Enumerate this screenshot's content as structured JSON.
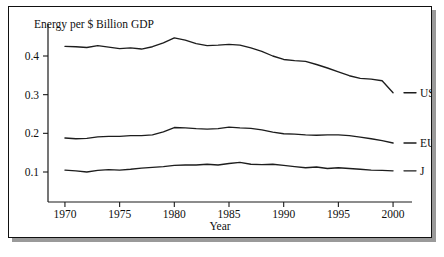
{
  "chart_data": {
    "type": "line",
    "title": "",
    "ylabel": "Energy per $ Billion GDP",
    "xlabel": "Year",
    "xlim": [
      1969,
      2001
    ],
    "ylim": [
      0.0,
      0.47
    ],
    "grid": false,
    "legend_position": "right-of-line-ends",
    "xticks": [
      1970,
      1975,
      1980,
      1985,
      1990,
      1995,
      2000
    ],
    "xticklabels": [
      "1970",
      "1975",
      "1980",
      "1985",
      "1990",
      "1995",
      "2000"
    ],
    "yticks": [
      0.1,
      0.2,
      0.3,
      0.4
    ],
    "yticklabels": [
      "0.1",
      "0.2",
      "0.3",
      "0.4"
    ],
    "x": [
      1970,
      1971,
      1972,
      1973,
      1974,
      1975,
      1976,
      1977,
      1978,
      1979,
      1980,
      1981,
      1982,
      1983,
      1984,
      1985,
      1986,
      1987,
      1988,
      1989,
      1990,
      1991,
      1992,
      1993,
      1994,
      1995,
      1996,
      1997,
      1998,
      1999,
      2000
    ],
    "series": [
      {
        "name": "US",
        "label": "US",
        "color": "#1d1d1d",
        "values": [
          0.425,
          0.424,
          0.422,
          0.427,
          0.423,
          0.419,
          0.421,
          0.418,
          0.424,
          0.434,
          0.447,
          0.441,
          0.432,
          0.427,
          0.428,
          0.43,
          0.428,
          0.421,
          0.412,
          0.4,
          0.391,
          0.388,
          0.386,
          0.378,
          0.369,
          0.359,
          0.349,
          0.342,
          0.34,
          0.336,
          0.305
        ]
      },
      {
        "name": "EU",
        "label": "EU",
        "color": "#1d1d1d",
        "values": [
          0.188,
          0.186,
          0.187,
          0.191,
          0.192,
          0.192,
          0.194,
          0.194,
          0.196,
          0.204,
          0.215,
          0.214,
          0.212,
          0.211,
          0.212,
          0.216,
          0.214,
          0.213,
          0.209,
          0.203,
          0.199,
          0.198,
          0.196,
          0.195,
          0.196,
          0.196,
          0.194,
          0.19,
          0.186,
          0.181,
          0.175
        ]
      },
      {
        "name": "J",
        "label": "J",
        "color": "#1d1d1d",
        "values": [
          0.105,
          0.103,
          0.1,
          0.104,
          0.106,
          0.105,
          0.107,
          0.11,
          0.112,
          0.114,
          0.117,
          0.118,
          0.118,
          0.12,
          0.118,
          0.122,
          0.125,
          0.12,
          0.119,
          0.12,
          0.117,
          0.114,
          0.111,
          0.113,
          0.109,
          0.111,
          0.109,
          0.107,
          0.105,
          0.104,
          0.103
        ]
      }
    ]
  }
}
